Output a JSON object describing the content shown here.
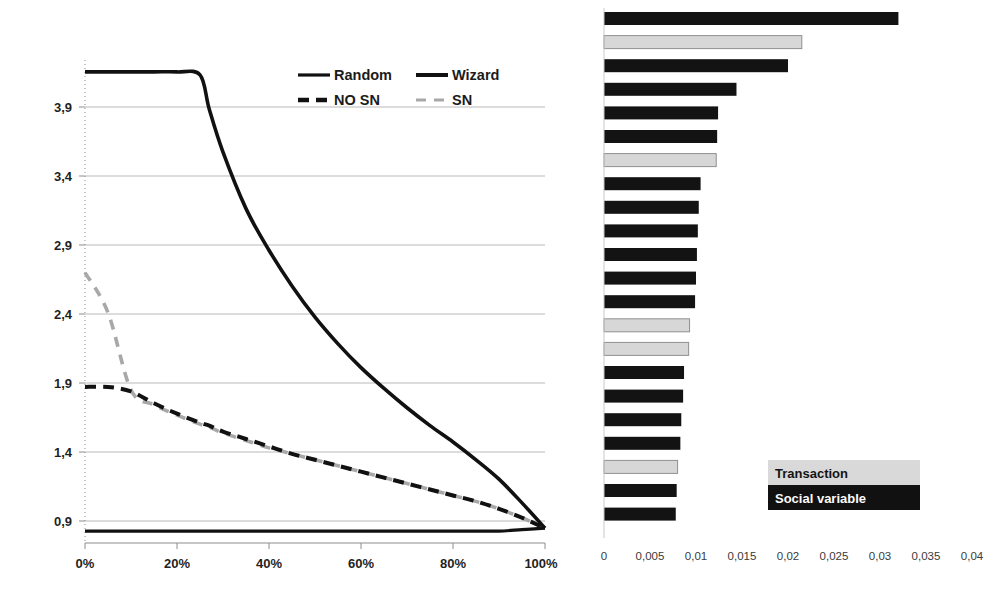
{
  "chart_data": [
    {
      "id": "left",
      "type": "line",
      "title": "",
      "xlabel": "",
      "ylabel": "",
      "xlim": [
        0,
        100
      ],
      "ylim": [
        0.9,
        4.15
      ],
      "grid": true,
      "x_tick_labels": [
        "0%",
        "20%",
        "40%",
        "60%",
        "80%",
        "100%"
      ],
      "x_tick_values": [
        0,
        20,
        40,
        60,
        80,
        100
      ],
      "y_tick_labels": [
        "0,9",
        "1,4",
        "1,9",
        "2,4",
        "2,9",
        "3,4",
        "3,9"
      ],
      "y_tick_values": [
        0.9,
        1.4,
        1.9,
        2.4,
        2.9,
        3.4,
        3.9
      ],
      "legend_position": "top-right",
      "legend": [
        "Random",
        "Wizard",
        "NO SN",
        "SN"
      ],
      "x": [
        0,
        5,
        10,
        15,
        20,
        25,
        27,
        30,
        35,
        40,
        45,
        50,
        55,
        60,
        65,
        70,
        75,
        80,
        85,
        90,
        95,
        100
      ],
      "series": [
        {
          "name": "Random",
          "style": "solid-black",
          "values": [
            0.98,
            0.98,
            0.98,
            0.98,
            0.98,
            0.98,
            0.98,
            0.98,
            0.98,
            0.98,
            0.98,
            0.98,
            0.98,
            0.98,
            0.98,
            0.98,
            0.98,
            0.98,
            0.98,
            0.98,
            0.99,
            1.0
          ]
        },
        {
          "name": "Wizard",
          "style": "solid-black-thick",
          "values": [
            4.07,
            4.07,
            4.07,
            4.07,
            4.07,
            4.05,
            3.82,
            3.53,
            3.15,
            2.87,
            2.63,
            2.42,
            2.24,
            2.08,
            1.94,
            1.81,
            1.69,
            1.58,
            1.46,
            1.33,
            1.17,
            1.0
          ]
        },
        {
          "name": "NO SN",
          "style": "dashed-black",
          "values": [
            1.95,
            1.95,
            1.92,
            1.84,
            1.77,
            1.71,
            1.69,
            1.65,
            1.6,
            1.55,
            1.5,
            1.46,
            1.42,
            1.38,
            1.34,
            1.3,
            1.26,
            1.22,
            1.18,
            1.13,
            1.07,
            1.0
          ]
        },
        {
          "name": "SN",
          "style": "dashed-gray",
          "values": [
            2.72,
            2.45,
            1.93,
            1.83,
            1.76,
            1.7,
            1.68,
            1.64,
            1.59,
            1.54,
            1.5,
            1.46,
            1.42,
            1.38,
            1.34,
            1.3,
            1.26,
            1.22,
            1.18,
            1.13,
            1.07,
            1.0
          ]
        }
      ]
    },
    {
      "id": "right",
      "type": "bar",
      "orientation": "horizontal",
      "title": "",
      "xlabel": "",
      "ylabel": "",
      "xlim": [
        0,
        0.04
      ],
      "grid": false,
      "x_tick_labels": [
        "0",
        "0,005",
        "0,01",
        "0,015",
        "0,02",
        "0,025",
        "0,03",
        "0,035",
        "0,04"
      ],
      "x_tick_values": [
        0,
        0.005,
        0.01,
        0.015,
        0.02,
        0.025,
        0.03,
        0.035,
        0.04
      ],
      "legend_position": "inside-bottom-right",
      "legend": [
        {
          "label": "Transaction",
          "color": "#d9d9d9"
        },
        {
          "label": "Social variable",
          "color": "#111111"
        }
      ],
      "categories": [
        "",
        "",
        "",
        "",
        "",
        "",
        "",
        "",
        "",
        "",
        "",
        "",
        "",
        "",
        "",
        "",
        "",
        "",
        "",
        "",
        "",
        ""
      ],
      "values": [
        0.032,
        0.0215,
        0.02,
        0.0144,
        0.0124,
        0.0123,
        0.0122,
        0.0105,
        0.0103,
        0.0102,
        0.0101,
        0.01,
        0.0099,
        0.0093,
        0.0092,
        0.0087,
        0.0086,
        0.0084,
        0.0083,
        0.008,
        0.0079,
        0.0078
      ],
      "value_types": [
        "social",
        "transaction",
        "social",
        "social",
        "social",
        "social",
        "transaction",
        "social",
        "social",
        "social",
        "social",
        "social",
        "social",
        "transaction",
        "transaction",
        "social",
        "social",
        "social",
        "social",
        "transaction",
        "social",
        "social"
      ]
    }
  ],
  "line_chart_legend": {
    "random": "Random",
    "wizard": "Wizard",
    "no_sn": "NO SN",
    "sn": "SN"
  },
  "line_chart_axis": {
    "y0": "0,9",
    "y1": "1,4",
    "y2": "1,9",
    "y3": "2,4",
    "y4": "2,9",
    "y5": "3,4",
    "y6": "3,9",
    "x0": "0%",
    "x1": "20%",
    "x2": "40%",
    "x3": "60%",
    "x4": "80%",
    "x5": "100%"
  },
  "bar_chart_axis": {
    "t0": "0",
    "t1": "0,005",
    "t2": "0,01",
    "t3": "0,015",
    "t4": "0,02",
    "t5": "0,025",
    "t6": "0,03",
    "t7": "0,035",
    "t8": "0,04"
  },
  "bar_chart_legend": {
    "transaction": "Transaction",
    "social_variable": "Social variable"
  },
  "colors": {
    "social_variable": "#131313",
    "transaction": "#d7d7d7",
    "grid": "#b9b9b9",
    "axis": "#8d8d8d",
    "sn_gray": "#a8a8a8"
  }
}
